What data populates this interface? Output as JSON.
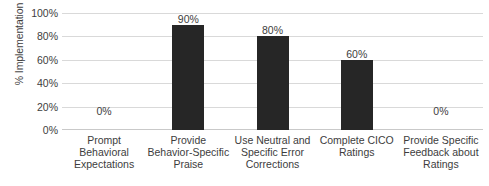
{
  "chart_data": {
    "type": "bar",
    "title": "",
    "xlabel": "",
    "ylabel": "% Implementation",
    "ylim": [
      0,
      100
    ],
    "grid": "horizontal",
    "legend": "none",
    "bar_color": "#262626",
    "gridline_color": "#d9d9d9",
    "text_color": "#3d3d3d",
    "categories": [
      "Prompt Behavioral Expectations",
      "Provide Behavior-Specific Praise",
      "Use Neutral and Specific Error Corrections",
      "Complete CICO Ratings",
      "Provide Specific Feedback about Ratings"
    ],
    "values": [
      0,
      90,
      80,
      60,
      0
    ],
    "data_labels": [
      "0%",
      "90%",
      "80%",
      "60%",
      "0%"
    ],
    "y_ticks": [
      100,
      80,
      60,
      40,
      20,
      0
    ],
    "y_tick_labels": [
      "100%",
      "80%",
      "60%",
      "40%",
      "20%",
      "0%"
    ]
  }
}
